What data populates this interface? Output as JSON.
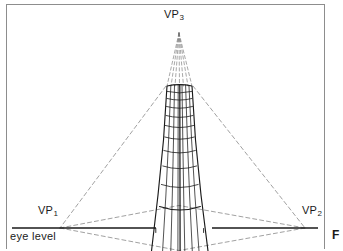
{
  "figure": {
    "type": "three-point-perspective-diagram",
    "caption_marker": "F"
  },
  "labels": {
    "vp3": {
      "text": "VP",
      "sub": "3"
    },
    "vp1": {
      "text": "VP",
      "sub": "1"
    },
    "vp2": {
      "text": "VP",
      "sub": "2"
    },
    "eye_level": "eye level"
  },
  "colors": {
    "ink": "#1a1a1a",
    "frame": "#8d8d8d",
    "construction": "#5a5a5a",
    "paper": "#ffffff"
  },
  "geometry": {
    "vp3": {
      "x": 179,
      "y": 31
    },
    "vp1": {
      "x": 60,
      "y": 228
    },
    "vp2": {
      "x": 305,
      "y": 228
    },
    "horizon_y": 228,
    "horizon_left_x": 12,
    "horizon_right_x": 318,
    "horizon_gap": {
      "from": 156,
      "to": 212
    },
    "tower_top_y": 85,
    "tower_bottom_y": 249,
    "tower_top_left_x": 167,
    "tower_top_right_x": 192,
    "tower_base_left_x": 146,
    "tower_base_right_x": 213
  }
}
